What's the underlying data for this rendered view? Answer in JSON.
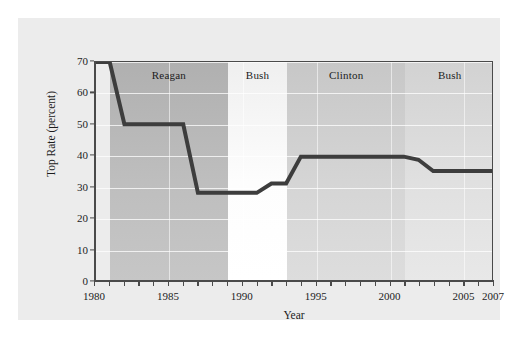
{
  "chart_data": {
    "type": "line",
    "title": "",
    "xlabel": "Year",
    "ylabel": "Top Rate (percent)",
    "xlim": [
      1980,
      2007
    ],
    "ylim": [
      0,
      70
    ],
    "grid": true,
    "legend": "none",
    "y_ticks": [
      0,
      10,
      20,
      30,
      40,
      50,
      60,
      70
    ],
    "x_ticks": [
      1980,
      1981,
      1982,
      1983,
      1984,
      1985,
      1986,
      1987,
      1988,
      1989,
      1990,
      1991,
      1992,
      1993,
      1994,
      1995,
      1996,
      1997,
      1998,
      1999,
      2000,
      2001,
      2002,
      2003,
      2004,
      2005,
      2006,
      2007
    ],
    "x_tick_labels": [
      {
        "year": 1980,
        "label": "1980"
      },
      {
        "year": 1985,
        "label": "1985"
      },
      {
        "year": 1990,
        "label": "1990"
      },
      {
        "year": 1995,
        "label": "1995"
      },
      {
        "year": 2000,
        "label": "2000"
      },
      {
        "year": 2005,
        "label": "2005"
      },
      {
        "year": 2007,
        "label": "2007"
      }
    ],
    "series": [
      {
        "name": "Top Marginal Tax Rate",
        "color": "#3d3d3d",
        "x": [
          1980,
          1981,
          1982,
          1986,
          1987,
          1988,
          1991,
          1992,
          1993,
          1994,
          2000,
          2001,
          2002,
          2003,
          2007
        ],
        "values": [
          70,
          70,
          50,
          50,
          28,
          28,
          28,
          31,
          31,
          39.6,
          39.6,
          39.6,
          38.6,
          35,
          35
        ]
      }
    ],
    "bands": [
      {
        "name": "Reagan",
        "label": "Reagan",
        "start": 1981,
        "end": 1989,
        "shade": "dark",
        "color": "#b0b0b0"
      },
      {
        "name": "Bush-41",
        "label": "Bush",
        "start": 1989,
        "end": 1993,
        "shade": "light",
        "color": "#efefef"
      },
      {
        "name": "Clinton",
        "label": "Clinton",
        "start": 1993,
        "end": 2001,
        "shade": "mid",
        "color": "#c7c7c7"
      },
      {
        "name": "Bush-43",
        "label": "Bush",
        "start": 2001,
        "end": 2007,
        "shade": "mid",
        "color": "#d2d2d2"
      }
    ]
  },
  "figure": {
    "background_color": "#ffffff",
    "panel_color": "#ececec",
    "axis_color": "#4a4a4a",
    "line_color": "#3d3d3d"
  }
}
